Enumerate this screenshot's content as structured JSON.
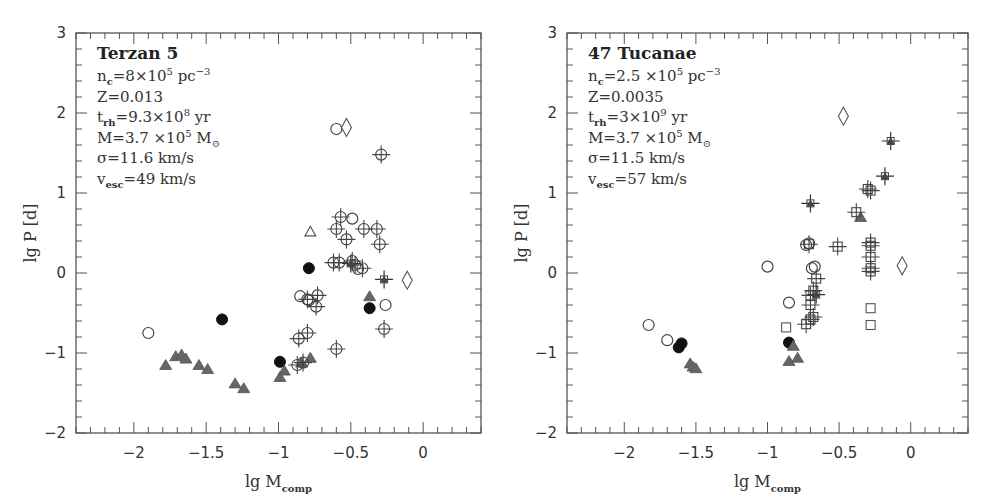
{
  "chart_data": [
    {
      "type": "scatter",
      "panel": "left",
      "title": "Terzan 5",
      "annotations": [
        {
          "base": "n",
          "sub": "c",
          "rest": "=8×10",
          "sup": "5",
          "tail": " pc",
          "tail_sup": "−3"
        },
        {
          "text": "Z=0.013"
        },
        {
          "base": "t",
          "sub": "rh",
          "rest": "=9.3×10",
          "sup": "8",
          "tail": " yr"
        },
        {
          "text": "M=3.7 ×10",
          "sup": "5",
          "tail": " M",
          "tail_sub": "⊙"
        },
        {
          "text": "σ=11.6 km/s"
        },
        {
          "base": "v",
          "sub": "esc",
          "rest": "=49 km/s"
        }
      ],
      "xlabel": "lg M_comp",
      "ylabel": "lg P [d]",
      "xlim": [
        -2.4,
        0.4
      ],
      "ylim": [
        -2,
        3
      ],
      "xticks": [
        -2,
        -1.5,
        -1,
        -0.5,
        0
      ],
      "yticks": [
        -2,
        -1,
        0,
        1,
        2,
        3
      ],
      "series": [
        {
          "name": "open-circle",
          "marker": "circle-open",
          "points": [
            [
              -0.6,
              1.8
            ],
            [
              -0.49,
              0.68
            ],
            [
              -0.85,
              -0.29
            ],
            [
              -0.79,
              -0.34
            ],
            [
              -0.26,
              -0.4
            ],
            [
              -1.9,
              -0.75
            ],
            [
              -0.45,
              0.05
            ]
          ]
        },
        {
          "name": "filled-circle",
          "marker": "circle-filled",
          "points": [
            [
              -0.79,
              0.06
            ],
            [
              -0.37,
              -0.44
            ],
            [
              -1.39,
              -0.58
            ],
            [
              -0.99,
              -1.11
            ]
          ]
        },
        {
          "name": "open-diamond",
          "marker": "diamond-open",
          "points": [
            [
              -0.53,
              1.82
            ],
            [
              -0.11,
              -0.09
            ]
          ]
        },
        {
          "name": "open-triangle",
          "marker": "triangle-open",
          "points": [
            [
              -0.78,
              0.52
            ]
          ]
        },
        {
          "name": "filled-triangle",
          "marker": "triangle-filled",
          "points": [
            [
              -1.78,
              -1.15
            ],
            [
              -1.71,
              -1.04
            ],
            [
              -1.67,
              -1.02
            ],
            [
              -1.64,
              -1.07
            ],
            [
              -1.55,
              -1.15
            ],
            [
              -1.49,
              -1.2
            ],
            [
              -1.3,
              -1.38
            ],
            [
              -1.24,
              -1.44
            ],
            [
              -0.37,
              -0.29
            ],
            [
              -0.99,
              -1.3
            ],
            [
              -0.96,
              -1.22
            ],
            [
              -0.84,
              -1.12
            ],
            [
              -0.78,
              -1.06
            ]
          ]
        },
        {
          "name": "crosshair-circle",
          "marker": "crosshair-circle",
          "points": [
            [
              -0.29,
              1.48
            ],
            [
              -0.57,
              0.7
            ],
            [
              -0.6,
              0.55
            ],
            [
              -0.41,
              0.55
            ],
            [
              -0.32,
              0.55
            ],
            [
              -0.53,
              0.42
            ],
            [
              -0.3,
              0.36
            ],
            [
              -0.62,
              0.13
            ],
            [
              -0.58,
              0.13
            ],
            [
              -0.49,
              0.15
            ],
            [
              -0.47,
              0.1
            ],
            [
              -0.42,
              0.06
            ],
            [
              -0.73,
              -0.28
            ],
            [
              -0.8,
              -0.33
            ],
            [
              -0.74,
              -0.42
            ],
            [
              -0.86,
              -0.82
            ],
            [
              -0.8,
              -0.75
            ],
            [
              -0.87,
              -1.15
            ],
            [
              -0.83,
              -1.12
            ],
            [
              -0.27,
              -0.7
            ],
            [
              -0.6,
              -0.95
            ]
          ]
        },
        {
          "name": "cross",
          "marker": "cross",
          "points": [
            [
              -0.27,
              -0.08
            ],
            [
              -0.5,
              0.12
            ]
          ]
        }
      ]
    },
    {
      "type": "scatter",
      "panel": "right",
      "title": "47 Tucanae",
      "annotations": [
        {
          "base": "n",
          "sub": "c",
          "rest": "=2.5 ×10",
          "sup": "5",
          "tail": " pc",
          "tail_sup": "−3"
        },
        {
          "text": "Z=0.0035"
        },
        {
          "base": "t",
          "sub": "rh",
          "rest": "=3×10",
          "sup": "9",
          "tail": " yr"
        },
        {
          "text": "M=3.7 ×10",
          "sup": "5",
          "tail": " M",
          "tail_sub": "⊙"
        },
        {
          "text": "σ=11.5 km/s"
        },
        {
          "base": "v",
          "sub": "esc",
          "rest": "=57 km/s"
        }
      ],
      "xlabel": "lg M_comp",
      "ylabel": "lg P [d]",
      "xlim": [
        -2.4,
        0.4
      ],
      "ylim": [
        -2,
        3
      ],
      "xticks": [
        -2,
        -1.5,
        -1,
        -0.5,
        0
      ],
      "yticks": [
        -2,
        -1,
        0,
        1,
        2,
        3
      ],
      "series": [
        {
          "name": "open-circle",
          "marker": "circle-open",
          "points": [
            [
              -1.83,
              -0.65
            ],
            [
              -1.7,
              -0.84
            ],
            [
              -1.0,
              0.08
            ],
            [
              -0.85,
              -0.37
            ],
            [
              -0.73,
              0.35
            ],
            [
              -0.71,
              0.37
            ],
            [
              -0.69,
              0.06
            ],
            [
              -0.67,
              0.08
            ]
          ]
        },
        {
          "name": "filled-circle",
          "marker": "circle-filled",
          "points": [
            [
              -1.62,
              -0.93
            ],
            [
              -1.6,
              -0.88
            ],
            [
              -0.85,
              -0.87
            ]
          ]
        },
        {
          "name": "open-diamond",
          "marker": "diamond-open",
          "points": [
            [
              -0.47,
              1.96
            ],
            [
              -0.06,
              0.09
            ]
          ]
        },
        {
          "name": "open-square",
          "marker": "square-open",
          "points": [
            [
              -0.87,
              -0.68
            ],
            [
              -0.28,
              -0.44
            ],
            [
              -0.28,
              -0.65
            ]
          ]
        },
        {
          "name": "filled-triangle",
          "marker": "triangle-filled",
          "points": [
            [
              -1.54,
              -1.13
            ],
            [
              -1.52,
              -1.17
            ],
            [
              -1.5,
              -1.19
            ],
            [
              -0.82,
              -0.91
            ],
            [
              -0.85,
              -1.1
            ],
            [
              -0.79,
              -1.06
            ],
            [
              -0.35,
              0.7
            ]
          ]
        },
        {
          "name": "crosshair-square",
          "marker": "crosshair-square",
          "points": [
            [
              -0.71,
              0.36
            ],
            [
              -0.51,
              0.33
            ],
            [
              -0.28,
              0.38
            ],
            [
              -0.28,
              0.34
            ],
            [
              -0.28,
              0.2
            ],
            [
              -0.28,
              0.06
            ],
            [
              -0.28,
              0.02
            ],
            [
              -0.66,
              -0.07
            ],
            [
              -0.68,
              -0.22
            ],
            [
              -0.7,
              -0.28
            ],
            [
              -0.7,
              -0.4
            ],
            [
              -0.68,
              -0.55
            ],
            [
              -0.7,
              -0.58
            ],
            [
              -0.73,
              -0.64
            ],
            [
              -0.38,
              0.76
            ],
            [
              -0.3,
              1.05
            ],
            [
              -0.28,
              1.03
            ]
          ]
        },
        {
          "name": "cross",
          "marker": "cross",
          "points": [
            [
              -0.7,
              0.87
            ],
            [
              -0.18,
              1.21
            ],
            [
              -0.14,
              1.65
            ],
            [
              -0.66,
              -0.27
            ]
          ]
        }
      ]
    }
  ]
}
